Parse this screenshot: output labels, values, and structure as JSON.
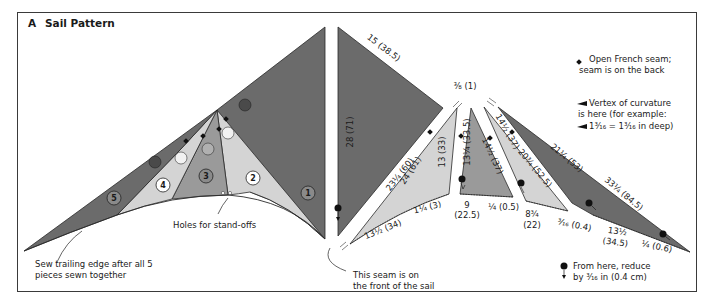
{
  "figure": {
    "panel_letter": "A",
    "title": "Sail Pattern"
  },
  "colors": {
    "dark_panel": "#6b6b6b",
    "mid_panel": "#9a9a9a",
    "light_panel": "#c9c9c9",
    "lighter_panel": "#d9d9d9",
    "outline": "#2a2a2a",
    "frame": "#3a3a3a"
  },
  "assembled_sail": {
    "pieces": [
      {
        "number": "1",
        "shade": "dark"
      },
      {
        "number": "2",
        "shade": "light"
      },
      {
        "number": "3",
        "shade": "mid"
      },
      {
        "number": "4",
        "shade": "light"
      },
      {
        "number": "5",
        "shade": "dark"
      }
    ],
    "callouts": {
      "holes": "Holes for stand-offs",
      "trailing_edge_line1": "Sew trailing edge after all 5",
      "trailing_edge_line2": "pieces sewn together"
    }
  },
  "pattern_pieces": {
    "piece1": {
      "edge_long": "28 (71)",
      "edge_top": "15 (38.5)",
      "edge_diag": "23¼ (60)"
    },
    "piece2": {
      "edge_left": "24 (61)",
      "edge_right": "13 (33)",
      "edge_bottom": "13½ (34)",
      "depth": "1¼ (3)"
    },
    "piece3": {
      "edge_left": "13¼ (33.5)",
      "edge_right": "14½ (37)",
      "edge_bottom_line1": "9",
      "edge_bottom_line2": "(22.5)",
      "depth": "¼ (0.5)"
    },
    "piece4": {
      "edge_left": "14½ (37)",
      "edge_right": "20¾ (52.5)",
      "edge_bottom_line1": "8¾",
      "edge_bottom_line2": "(22)",
      "depth": "³⁄₁₆ (0.4)"
    },
    "piece5": {
      "edge_top": "21¼ (53)",
      "edge_long": "33¼ (84.5)",
      "edge_bottom_line1": "13½",
      "edge_bottom_line2": "(34.5)",
      "depth": "¼ (0.6)"
    },
    "gap_label": "⅜ (1)",
    "seam_note_line1": "This seam is on",
    "seam_note_line2": "the front of the sail"
  },
  "legend": {
    "french_seam_line1": "Open French seam;",
    "french_seam_line2": "seam is on the back",
    "vertex_line1": "Vertex of curvature",
    "vertex_line2": "is here (for example:",
    "vertex_line3": "1³⁄₁₆ = 1³⁄₁₆ in deep)",
    "reduce_line1": "From here, reduce",
    "reduce_line2": "by ³⁄₁₆ in (0.4 cm)"
  }
}
